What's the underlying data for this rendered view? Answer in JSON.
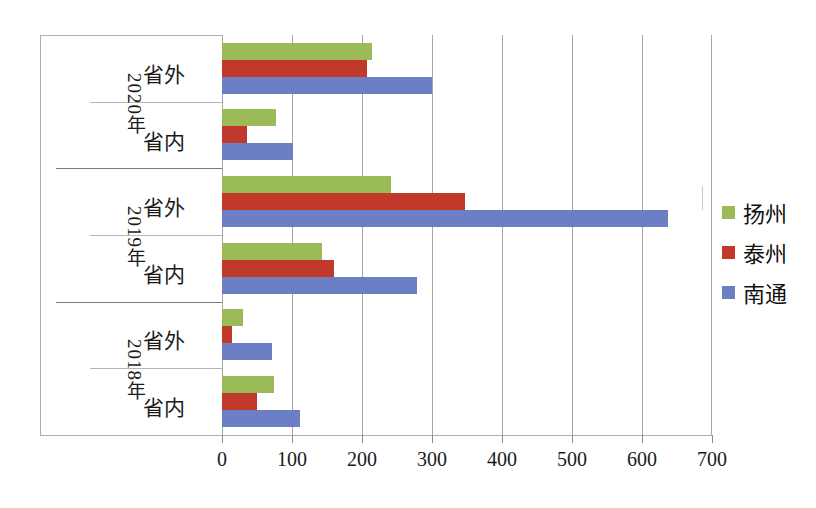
{
  "chart_data": {
    "type": "bar",
    "orientation": "horizontal",
    "title": "",
    "xlabel": "",
    "ylabel": "",
    "xlim": [
      0,
      700
    ],
    "xticks": [
      "0",
      "100",
      "200",
      "300",
      "400",
      "500",
      "600",
      "700"
    ],
    "grid": true,
    "legend_position": "right",
    "groups": [
      {
        "year": "2020年",
        "categories": [
          {
            "label": "省外",
            "values": {
              "扬州": 214,
              "泰州": 207,
              "南通": 300
            }
          },
          {
            "label": "省内",
            "values": {
              "扬州": 77,
              "泰州": 36,
              "南通": 101
            }
          }
        ]
      },
      {
        "year": "2019年",
        "categories": [
          {
            "label": "省外",
            "values": {
              "扬州": 241,
              "泰州": 347,
              "南通": 637
            }
          },
          {
            "label": "省内",
            "values": {
              "扬州": 143,
              "泰州": 160,
              "南通": 278
            }
          }
        ]
      },
      {
        "year": "2018年",
        "categories": [
          {
            "label": "省外",
            "values": {
              "扬州": 30,
              "泰州": 14,
              "南通": 71
            }
          },
          {
            "label": "省内",
            "values": {
              "扬州": 74,
              "泰州": 50,
              "南通": 111
            }
          }
        ]
      }
    ],
    "series": [
      {
        "name": "扬州",
        "color": "#9BBB59",
        "values": [
          214,
          77,
          241,
          143,
          30,
          74
        ]
      },
      {
        "name": "泰州",
        "color": "#C0392B",
        "values": [
          207,
          36,
          347,
          160,
          14,
          50
        ]
      },
      {
        "name": "南通",
        "color": "#6C7FC4",
        "values": [
          300,
          101,
          637,
          278,
          71,
          111
        ]
      }
    ],
    "category_order": [
      "2020年 省外",
      "2020年 省内",
      "2019年 省外",
      "2019年 省内",
      "2018年 省外",
      "2018年 省内"
    ]
  },
  "legend": {
    "items": [
      {
        "label": "扬州",
        "color": "#9BBB59"
      },
      {
        "label": "泰州",
        "color": "#C0392B"
      },
      {
        "label": "南通",
        "color": "#6C7FC4"
      }
    ]
  },
  "axis": {
    "ticks": [
      "0",
      "100",
      "200",
      "300",
      "400",
      "500",
      "600",
      "700"
    ]
  },
  "row_labels": {
    "r0": "省外",
    "r1": "省内",
    "r2": "省外",
    "r3": "省内",
    "r4": "省外",
    "r5": "省内"
  },
  "year_labels": {
    "y0": "2020年",
    "y1": "2019年",
    "y2": "2018年"
  }
}
